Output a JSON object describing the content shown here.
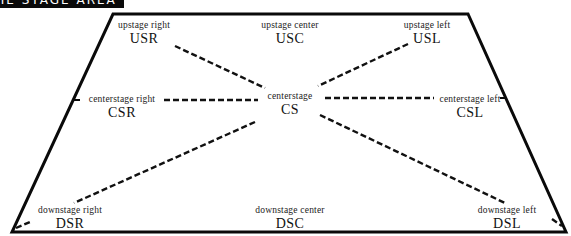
{
  "header": {
    "title": "THE STAGE AREA"
  },
  "colors": {
    "outline": "#0a0a0a",
    "dash": "#111111",
    "background": "#ffffff",
    "header_bg": "#0a0a0a",
    "header_text": "#ffffff"
  },
  "stage": {
    "outline_points": "113,14 468,14 566,232 12,232",
    "positions": {
      "usr": {
        "name": "upstage right",
        "abbr": "USR",
        "x": 144,
        "y": 20
      },
      "usc": {
        "name": "upstage center",
        "abbr": "USC",
        "x": 290,
        "y": 20
      },
      "usl": {
        "name": "upstage left",
        "abbr": "USL",
        "x": 427,
        "y": 20
      },
      "csr": {
        "name": "centerstage right",
        "abbr": "CSR",
        "x": 122,
        "y": 95
      },
      "cs": {
        "name": "centerstage",
        "abbr": "CS",
        "x": 290,
        "y": 92
      },
      "csl": {
        "name": "centerstage left",
        "abbr": "CSL",
        "x": 470,
        "y": 95
      },
      "dsr": {
        "name": "downstage right",
        "abbr": "DSR",
        "x": 70,
        "y": 205
      },
      "dsc": {
        "name": "downstage center",
        "abbr": "DSC",
        "x": 290,
        "y": 205
      },
      "dsl": {
        "name": "downstage left",
        "abbr": "DSL",
        "x": 507,
        "y": 205
      }
    }
  }
}
